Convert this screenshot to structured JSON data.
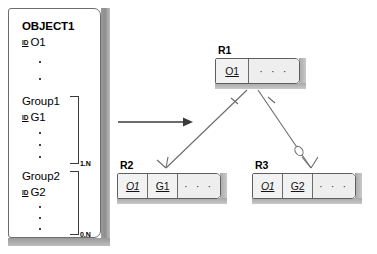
{
  "diagram": {
    "type": "er-to-relational-mapping",
    "object_box": {
      "title": "OBJECT1",
      "id_tag": "ID",
      "id_value": "O1",
      "groups": [
        {
          "name": "Group1",
          "id_tag": "ID",
          "id_value": "G1",
          "cardinality": "1.N"
        },
        {
          "name": "Group2",
          "id_tag": "ID",
          "id_value": "G2",
          "cardinality": "0.N"
        }
      ],
      "ellipsis_marker": "·"
    },
    "arrow": {
      "name": "maps-to-arrow",
      "direction": "right"
    },
    "relations": [
      {
        "key": "r1",
        "title": "R1",
        "cells": [
          {
            "text": "O1",
            "kind": "pk"
          },
          {
            "text": "· · ·",
            "kind": "dots"
          }
        ]
      },
      {
        "key": "r2",
        "title": "R2",
        "cells": [
          {
            "text": "O1",
            "kind": "fk"
          },
          {
            "text": "G1",
            "kind": "pk"
          },
          {
            "text": "· · ·",
            "kind": "dots"
          }
        ]
      },
      {
        "key": "r3",
        "title": "R3",
        "cells": [
          {
            "text": "O1",
            "kind": "fk"
          },
          {
            "text": "G2",
            "kind": "pk"
          },
          {
            "text": "· · ·",
            "kind": "dots"
          }
        ]
      }
    ],
    "connectors": [
      {
        "from": "r1",
        "to": "r2",
        "marker": "crows-foot",
        "optional": false
      },
      {
        "from": "r1",
        "to": "r3",
        "marker": "crows-foot",
        "optional": true
      }
    ],
    "colors": {
      "line": "#5e5e5e",
      "cell_fill": "#f2f2f2",
      "dots_fill": "#eeeeee",
      "shadow": "#a8a8a8",
      "text": "#000000"
    }
  }
}
